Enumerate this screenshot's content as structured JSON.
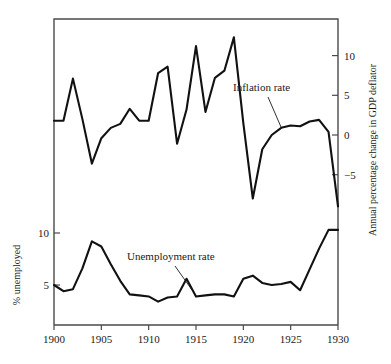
{
  "chart_data": {
    "type": "line",
    "title": "",
    "subtitle": "",
    "xlabel": "",
    "xlim": [
      1900,
      1930
    ],
    "grid": false,
    "legend_position": "inline-annotations",
    "x_ticks": [
      "1900",
      "1905",
      "1910",
      "1915",
      "1920",
      "1925",
      "1930"
    ],
    "x_tick_values": [
      1900,
      1905,
      1910,
      1915,
      1920,
      1925,
      1930
    ],
    "axes": [
      {
        "id": "left",
        "label": "% unemployed",
        "ticks": [
          "10",
          "5"
        ],
        "tick_values": [
          10,
          5
        ],
        "ylim": [
          1.2,
          22.5
        ]
      },
      {
        "id": "right",
        "label": "Annual percentage change in GDP deflator",
        "ticks": [
          "10",
          "5",
          "0",
          "-5"
        ],
        "tick_values": [
          10,
          5,
          0,
          -5
        ],
        "ylim": [
          -12.5,
          15.0
        ]
      }
    ],
    "series": [
      {
        "name": "Inflation rate",
        "axis": "right",
        "label": "Inflation rate",
        "color": "#111111",
        "x": [
          1900,
          1901,
          1902,
          1903,
          1904,
          1905,
          1906,
          1907,
          1908,
          1909,
          1910,
          1911,
          1912,
          1913,
          1914,
          1915,
          1916,
          1917,
          1918,
          1919,
          1920,
          1921,
          1922,
          1923,
          1924,
          1925,
          1926,
          1927,
          1928,
          1929,
          1930
        ],
        "values": [
          1.8,
          1.8,
          7.1,
          2.0,
          -3.6,
          -0.4,
          0.9,
          1.4,
          3.3,
          1.8,
          1.8,
          7.8,
          8.6,
          -1.1,
          3.2,
          11.2,
          2.9,
          7.2,
          8.1,
          12.3,
          1.5,
          -8.0,
          -1.8,
          0.0,
          0.9,
          1.2,
          1.1,
          1.7,
          1.9,
          0.4,
          -9.0
        ]
      },
      {
        "name": "Unemployment rate",
        "axis": "left",
        "label": "Unemployment rate",
        "color": "#111111",
        "x": [
          1900,
          1901,
          1902,
          1903,
          1904,
          1905,
          1906,
          1907,
          1908,
          1909,
          1910,
          1911,
          1912,
          1913,
          1914,
          1915,
          1916,
          1917,
          1918,
          1919,
          1920,
          1921,
          1922,
          1923,
          1924,
          1925,
          1926,
          1927,
          1928,
          1929,
          1930
        ],
        "values": [
          5.0,
          4.4,
          4.6,
          6.6,
          9.2,
          8.7,
          7.0,
          5.4,
          4.1,
          4.0,
          3.9,
          3.4,
          3.8,
          3.9,
          5.6,
          3.9,
          4.0,
          4.1,
          4.1,
          3.9,
          5.6,
          5.9,
          5.2,
          5.0,
          5.1,
          5.3,
          4.5,
          6.5,
          8.5,
          10.3,
          10.3
        ]
      }
    ],
    "annotations": [
      {
        "name": "inflation-rate-label",
        "text": "Inflation rate",
        "x_px": 233,
        "y_px": 91,
        "leader": {
          "x1": 268,
          "y1": 97,
          "x2": 281,
          "y2": 127
        }
      },
      {
        "name": "unemployment-rate-label",
        "text": "Unemployment rate",
        "x_px": 127,
        "y_px": 260,
        "leader": {
          "x1": 175,
          "y1": 266,
          "x2": 192,
          "y2": 290
        }
      }
    ],
    "geometry": {
      "plot_left": 54,
      "plot_right": 338,
      "plot_top": 19,
      "plot_bottom": 325,
      "right_axis_zero_y": 135,
      "right_axis_px_per_unit": 7.94,
      "left_axis_ten_y": 233,
      "left_axis_five_y": 285,
      "x_px_per_year": 9.4667
    }
  }
}
